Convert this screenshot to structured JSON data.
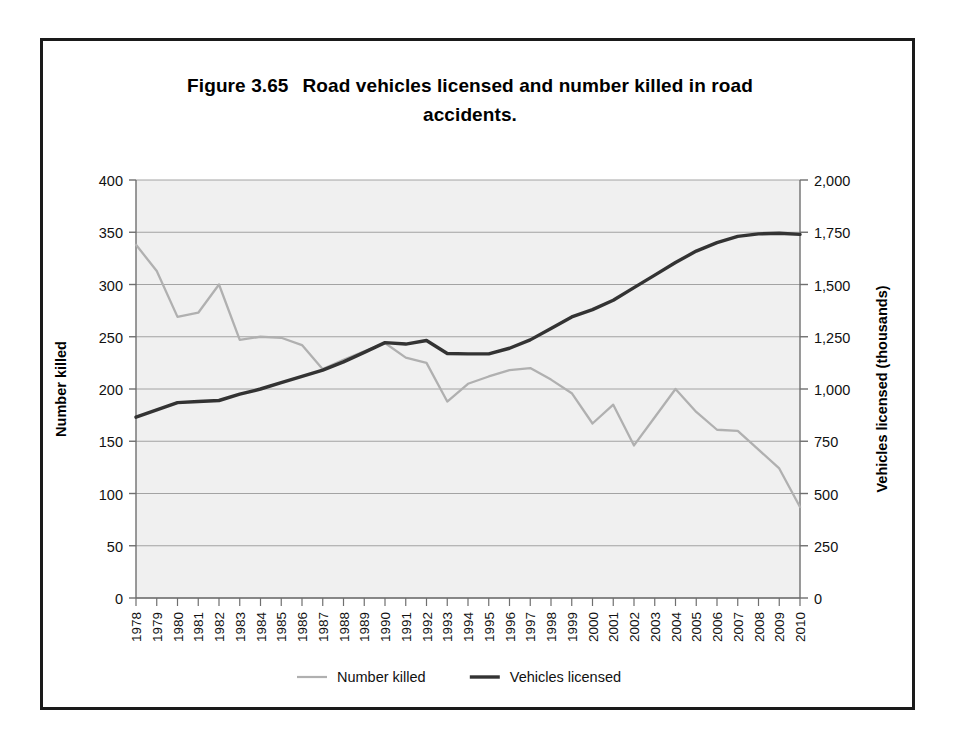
{
  "figure": {
    "number": "Figure 3.65",
    "title_line1": "Road vehicles licensed and number killed in road",
    "title_line2": "accidents."
  },
  "colors": {
    "frame": "#1a1a1a",
    "plot_background": "#f0f0f0",
    "gridline": "#9a9a9a",
    "axis": "#6f6f6f",
    "series_number_killed": "#b0b0b0",
    "series_vehicles_licensed": "#333333",
    "text": "#111111"
  },
  "chart_data": {
    "type": "line",
    "xlabel": "",
    "ylabel": "Number killed",
    "y2label": "Vehicles licensed (thousands)",
    "grid": true,
    "legend_position": "bottom",
    "ylim": [
      0,
      400
    ],
    "y2lim": [
      0,
      2000
    ],
    "yticks": [
      0,
      50,
      100,
      150,
      200,
      250,
      300,
      350,
      400
    ],
    "ytick_labels": [
      "0",
      "50",
      "100",
      "150",
      "200",
      "250",
      "300",
      "350",
      "400"
    ],
    "y2ticks": [
      0,
      250,
      500,
      750,
      1000,
      1250,
      1500,
      1750,
      2000
    ],
    "y2tick_labels": [
      "0",
      "250",
      "500",
      "750",
      "1,000",
      "1,250",
      "1,500",
      "1,750",
      "2,000"
    ],
    "categories": [
      "1978",
      "1979",
      "1980",
      "1981",
      "1982",
      "1983",
      "1984",
      "1985",
      "1986",
      "1987",
      "1988",
      "1989",
      "1990",
      "1991",
      "1992",
      "1993",
      "1994",
      "1995",
      "1996",
      "1997",
      "1998",
      "1999",
      "2000",
      "2001",
      "2002",
      "2003",
      "2004",
      "2005",
      "2006",
      "2007",
      "2008",
      "2009",
      "2010"
    ],
    "series": [
      {
        "name": "Number killed",
        "axis": "left",
        "color": "#b0b0b0",
        "values": [
          338,
          313,
          269,
          273,
          300,
          247,
          250,
          249,
          242,
          219,
          228,
          236,
          244,
          230,
          225,
          188,
          205,
          212,
          218,
          220,
          209,
          196,
          167,
          185,
          146,
          173,
          200,
          178,
          161,
          160,
          142,
          124,
          87
        ]
      },
      {
        "name": "Vehicles licensed",
        "axis": "right",
        "color": "#333333",
        "values": [
          865,
          900,
          935,
          940,
          945,
          975,
          1000,
          1030,
          1060,
          1090,
          1130,
          1175,
          1222,
          1215,
          1232,
          1170,
          1168,
          1168,
          1195,
          1235,
          1290,
          1345,
          1380,
          1425,
          1485,
          1545,
          1605,
          1660,
          1700,
          1730,
          1742,
          1745,
          1740
        ]
      }
    ],
    "legend": [
      {
        "label": "Number killed",
        "color": "#b0b0b0",
        "width": 2.2
      },
      {
        "label": "Vehicles licensed",
        "color": "#333333",
        "width": 3.4
      }
    ]
  }
}
